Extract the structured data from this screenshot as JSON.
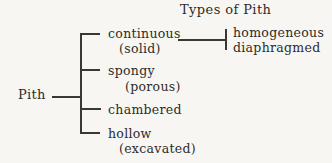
{
  "title": "Types of Pith",
  "root_label": "Pith",
  "branches": [
    {
      "name": "continuous",
      "detail": "(solid)"
    },
    {
      "name": "spongy",
      "detail": "(porous)"
    },
    {
      "name": "chambered",
      "detail": ""
    },
    {
      "name": "hollow",
      "detail": "(excavated)"
    }
  ],
  "continuous_subtypes": [
    "homogeneous",
    "diaphragmed"
  ],
  "colors": {
    "background": "#f7f6f3",
    "ink": "#2e2c28",
    "line": "#3a3833"
  }
}
